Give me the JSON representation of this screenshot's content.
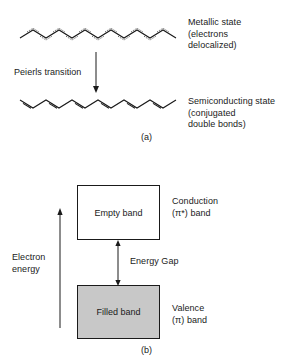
{
  "figure": {
    "panels": [
      {
        "id": "a",
        "letter": "(a)",
        "structures": [
          {
            "name": "metallic-chain",
            "bond_style": "delocalized",
            "label": "Metallic state\n(electrons\ndelocalized)"
          },
          {
            "name": "semiconducting-chain",
            "bond_style": "alternating-double",
            "label": "Semiconducting state\n(conjugated\ndouble bonds)"
          }
        ],
        "transition_label": "Peierls transition",
        "arrow_direction": "down"
      },
      {
        "id": "b",
        "letter": "(b)",
        "bands": [
          {
            "name": "conduction-band",
            "box_label": "Empty band",
            "side_label": "Conduction\n(π*) band",
            "fill": "#ffffff"
          },
          {
            "name": "valence-band",
            "box_label": "Filled band",
            "side_label": "Valence\n(π) band",
            "fill": "#c8c8c8"
          }
        ],
        "gap_label": "Energy Gap",
        "axis_label": "Electron\nenergy",
        "axis_direction": "up"
      }
    ],
    "colors": {
      "ink": "#1a1a1a",
      "filled_band": "#c8c8c8",
      "background": "#ffffff"
    }
  }
}
